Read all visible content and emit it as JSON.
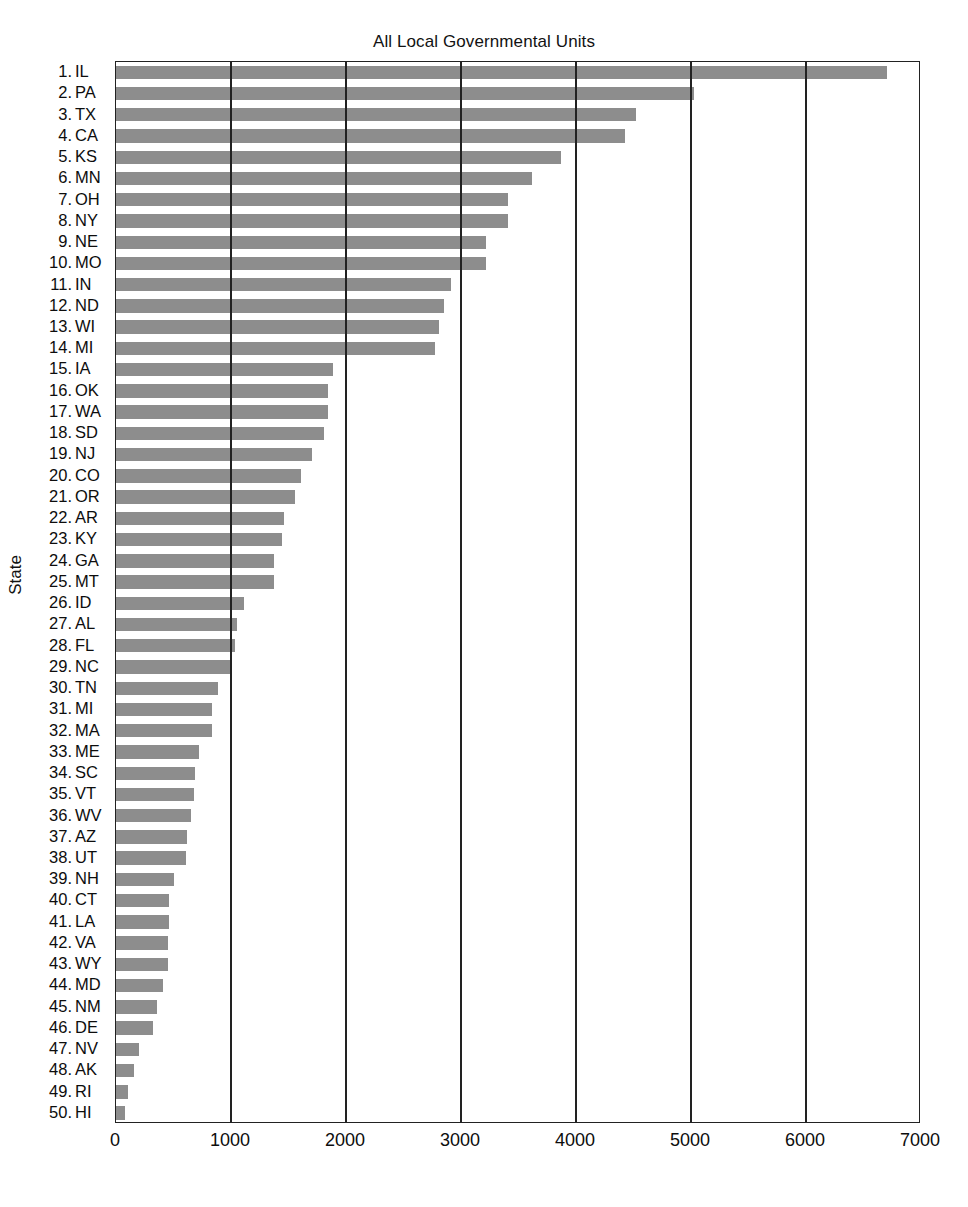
{
  "chart_data": {
    "type": "bar",
    "orientation": "horizontal",
    "title": "All Local Governmental Units",
    "xlabel": "",
    "ylabel": "State",
    "xlim": [
      0,
      7000
    ],
    "xticks": [
      0,
      1000,
      2000,
      3000,
      4000,
      5000,
      6000,
      7000
    ],
    "xtick_labels": [
      "0",
      "1000",
      "2000",
      "3000",
      "4000",
      "5000",
      "6000",
      "7000"
    ],
    "grid": "vertical",
    "legend": null,
    "bar_color": "#8d8d8d",
    "axis_color": "#222222",
    "categories": [
      "1. IL",
      "2. PA",
      "3. TX",
      "4. CA",
      "5. KS",
      "6. MN",
      "7. OH",
      "8. NY",
      "9. NE",
      "10. MO",
      "11. IN",
      "12. ND",
      "13. WI",
      "14. MI",
      "15. IA",
      "16. OK",
      "17. WA",
      "18. SD",
      "19. NJ",
      "20. CO",
      "21. OR",
      "22. AR",
      "23. KY",
      "24. GA",
      "25. MT",
      "26. ID",
      "27. AL",
      "28. FL",
      "29. NC",
      "30. TN",
      "31. MI",
      "32. MA",
      "33. ME",
      "34. SC",
      "35. VT",
      "36. WV",
      "37. AZ",
      "38. UT",
      "39. NH",
      "40. CT",
      "41. LA",
      "42. VA",
      "43. WY",
      "44. MD",
      "45. NM",
      "46. DE",
      "47. NV",
      "48. AK",
      "49. RI",
      "50. HI"
    ],
    "rank_labels": [
      "1.",
      "2.",
      "3.",
      "4.",
      "5.",
      "6.",
      "7.",
      "8.",
      "9.",
      "10.",
      "11.",
      "12.",
      "13.",
      "14.",
      "15.",
      "16.",
      "17.",
      "18.",
      "19.",
      "20.",
      "21.",
      "22.",
      "23.",
      "24.",
      "25.",
      "26.",
      "27.",
      "28.",
      "29.",
      "30.",
      "31.",
      "32.",
      "33.",
      "34.",
      "35.",
      "36.",
      "37.",
      "38.",
      "39.",
      "40.",
      "41.",
      "42.",
      "43.",
      "44.",
      "45.",
      "46.",
      "47.",
      "48.",
      "49.",
      "50."
    ],
    "state_abbrevs": [
      "IL",
      "PA",
      "TX",
      "CA",
      "KS",
      "MN",
      "OH",
      "NY",
      "NE",
      "MO",
      "IN",
      "ND",
      "WI",
      "MI",
      "IA",
      "OK",
      "WA",
      "SD",
      "NJ",
      "CO",
      "OR",
      "AR",
      "KY",
      "GA",
      "MT",
      "ID",
      "AL",
      "FL",
      "NC",
      "TN",
      "MI",
      "MA",
      "ME",
      "SC",
      "VT",
      "WV",
      "AZ",
      "UT",
      "NH",
      "CT",
      "LA",
      "VA",
      "WY",
      "MD",
      "NM",
      "DE",
      "NV",
      "AK",
      "RI",
      "HI"
    ],
    "values": [
      6700,
      5030,
      4520,
      4430,
      3870,
      3620,
      3410,
      3410,
      3215,
      3215,
      2910,
      2850,
      2805,
      2770,
      1890,
      1845,
      1845,
      1810,
      1705,
      1610,
      1555,
      1460,
      1445,
      1375,
      1375,
      1110,
      1050,
      1035,
      1000,
      885,
      835,
      835,
      725,
      690,
      675,
      655,
      615,
      605,
      500,
      465,
      465,
      450,
      450,
      410,
      360,
      325,
      200,
      160,
      105,
      80
    ]
  }
}
